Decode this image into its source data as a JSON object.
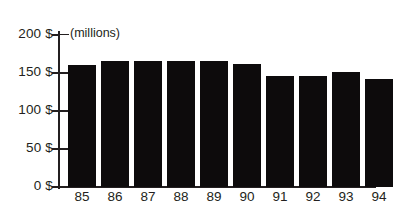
{
  "chart_data": {
    "type": "bar",
    "title": "",
    "subtitle": "",
    "xlabel": "",
    "ylabel": "",
    "units_note": "(millions)",
    "categories": [
      "85",
      "86",
      "87",
      "88",
      "89",
      "90",
      "91",
      "92",
      "93",
      "94"
    ],
    "values": [
      160,
      165,
      165,
      165,
      165,
      161,
      145,
      145,
      150,
      141
    ],
    "ylim": [
      0,
      200
    ],
    "ytick_values": [
      0,
      50,
      100,
      150,
      200
    ],
    "ytick_labels": [
      "0 $",
      "50 $",
      "100 $",
      "150 $",
      "200 $"
    ],
    "grid": false,
    "legend": null,
    "series": [
      {
        "name": "",
        "values": [
          160,
          165,
          165,
          165,
          165,
          161,
          145,
          145,
          150,
          141
        ]
      }
    ],
    "colors": {
      "bar": "#0d0b0c",
      "axis": "#231f20",
      "tick": "#6f6c6d",
      "text": "#231f20",
      "background": "#ffffff"
    }
  }
}
